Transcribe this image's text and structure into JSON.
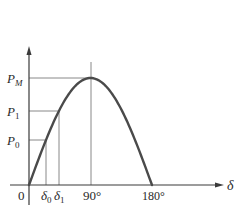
{
  "diagram": {
    "type": "power-angle curve",
    "colors": {
      "curve": "#4a4a4a",
      "axis": "#3a3a3a",
      "guide": "#6a6a6a",
      "text": "#2a2a2a"
    },
    "y_axis": {
      "labels": [
        {
          "id": "pm",
          "main": "P",
          "sub": "M"
        },
        {
          "id": "p1",
          "main": "P",
          "sub": "1"
        },
        {
          "id": "p0",
          "main": "P",
          "sub": "0"
        }
      ]
    },
    "x_axis": {
      "origin_label": "0",
      "axis_label": "δ",
      "labels": [
        {
          "id": "d0",
          "main": "δ",
          "sub": "0"
        },
        {
          "id": "d1",
          "main": "δ",
          "sub": "1"
        },
        {
          "id": "deg90",
          "text": "90°"
        },
        {
          "id": "deg180",
          "text": "180°"
        }
      ]
    },
    "curve": {
      "function": "P = PM·sin(δ)",
      "range_deg": [
        0,
        180
      ]
    }
  }
}
